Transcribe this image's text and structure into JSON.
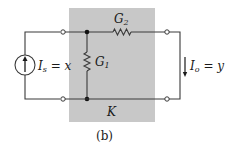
{
  "figure": {
    "caption": "(b)",
    "colors": {
      "box_fill": "#c8c8c8",
      "wire": "#3a3a3a",
      "background": "#ffffff"
    }
  },
  "components": {
    "source": {
      "symbol": "I",
      "subscript": "s",
      "equals": " = x",
      "type": "current-source",
      "direction": "up"
    },
    "g1": {
      "symbol": "G",
      "subscript": "1",
      "type": "resistor"
    },
    "g2": {
      "symbol": "G",
      "subscript": "2",
      "type": "resistor"
    },
    "output": {
      "symbol": "I",
      "subscript": "o",
      "equals": " = y",
      "direction": "down"
    },
    "box_label": "K"
  }
}
